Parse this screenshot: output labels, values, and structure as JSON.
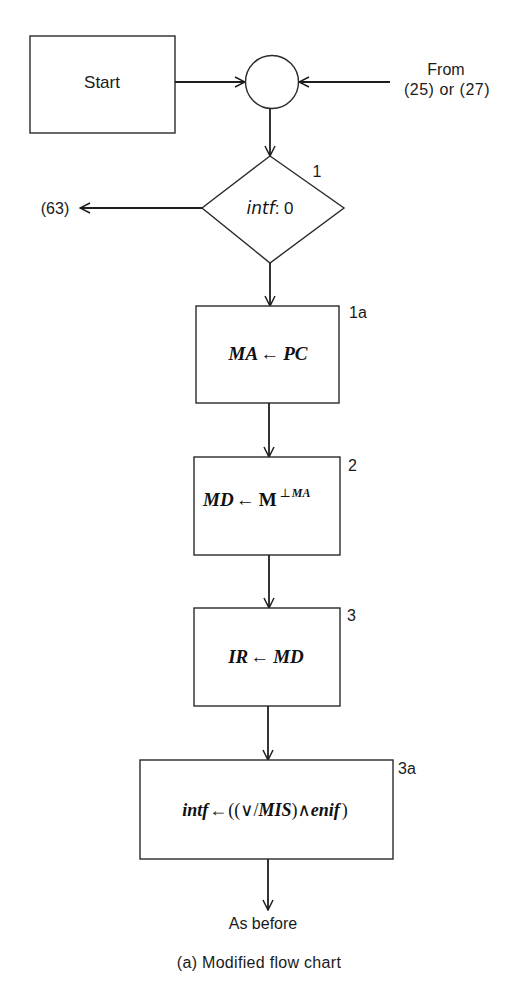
{
  "diagram": {
    "type": "flowchart",
    "caption": "(a) Modified flow chart",
    "colors": {
      "background": "#ffffff",
      "stroke": "#1e1e1e",
      "text": "#1a1a1a"
    },
    "start_box": {
      "label": "Start"
    },
    "connector": {
      "shape": "circle"
    },
    "incoming": {
      "line1": "From",
      "line2": "(25) or (27)"
    },
    "decision": {
      "step": "1",
      "var": "intf",
      "rest": ": 0",
      "exit_label": "(63)"
    },
    "steps": [
      {
        "step": "1a",
        "lhs": "MA",
        "arrow": "←",
        "rhs": "PC"
      },
      {
        "step": "2",
        "lhs": "MD",
        "arrow": "←",
        "rhs": "M",
        "rhs_sup_op": "⊥",
        "rhs_sup_var": "MA"
      },
      {
        "step": "3",
        "lhs": "IR",
        "arrow": "←",
        "rhs": "MD"
      },
      {
        "step": "3a",
        "lhs": "intf",
        "arrow": "←",
        "rhs_open": "((∨/",
        "rhs_var": "MIS",
        "rhs_mid": ")∧",
        "rhs_var2": "enif",
        "rhs_close": ")"
      }
    ],
    "exit": {
      "label": "As before"
    }
  }
}
